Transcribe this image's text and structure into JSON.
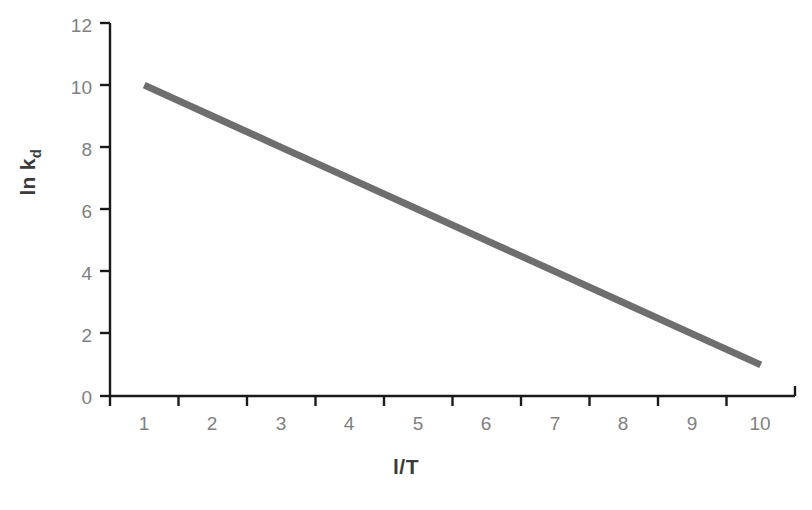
{
  "chart_data": {
    "type": "line",
    "title": "",
    "xlabel": "l/T",
    "ylabel_main": "ln k",
    "ylabel_sub": "d",
    "ylabel": "ln kd",
    "categories": [
      1,
      2,
      3,
      4,
      5,
      6,
      7,
      8,
      9,
      10
    ],
    "xtick_labels": [
      "1",
      "2",
      "3",
      "4",
      "5",
      "6",
      "7",
      "8",
      "9",
      "10"
    ],
    "ytick_labels": [
      "0",
      "2",
      "4",
      "6",
      "8",
      "10",
      "12"
    ],
    "ytick_values": [
      0,
      2,
      4,
      6,
      8,
      10,
      12
    ],
    "ylim": [
      0,
      12
    ],
    "grid": false,
    "legend": false,
    "series": [
      {
        "name": "ln kd vs l/T",
        "values": [
          10,
          9,
          8,
          7,
          6,
          5,
          4,
          3,
          2,
          1
        ],
        "color": "#6e6e6e",
        "line_width": 7
      }
    ],
    "axis_color": "#1a1a1a",
    "tick_label_color": "#808080",
    "axis_title_color": "#3b3b3b",
    "background": "#ffffff"
  }
}
